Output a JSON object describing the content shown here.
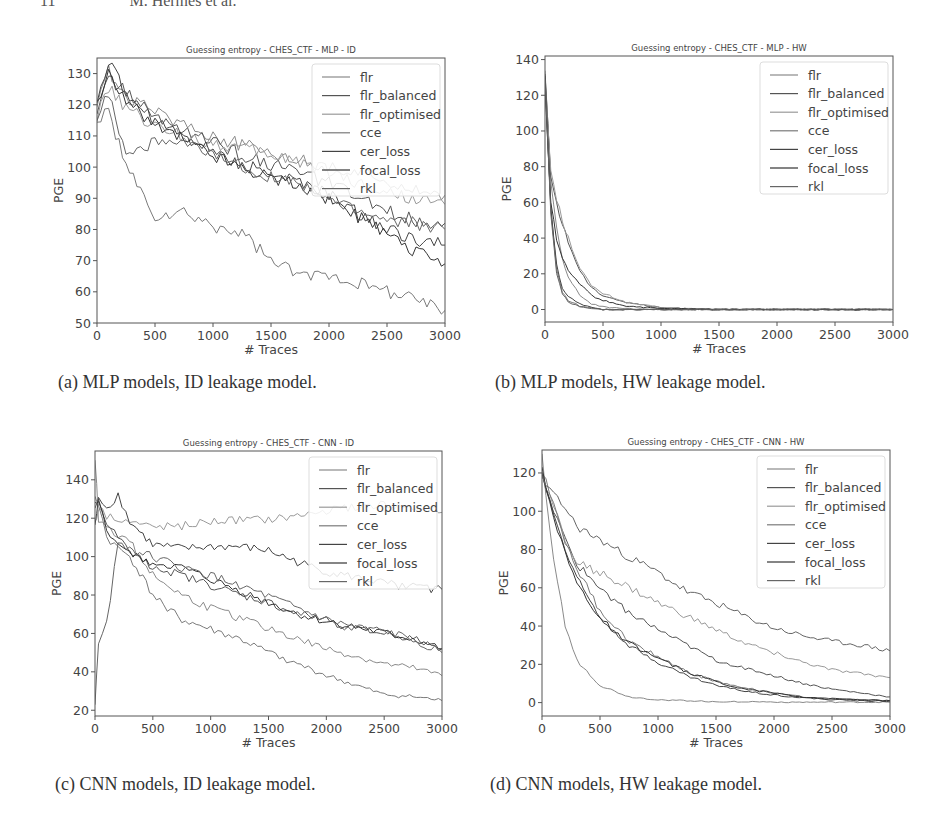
{
  "page_header": {
    "page_number": "11",
    "running_title": "M. Hermes et al."
  },
  "captions": {
    "a": "(a) MLP models, ID leakage model.",
    "b": "(b) MLP models, HW leakage model.",
    "c": "(c) CNN models, ID leakage model.",
    "d": "(d) CNN models, HW leakage model."
  },
  "legend_entries": [
    "flr",
    "flr_balanced",
    "flr_optimised",
    "cce",
    "cer_loss",
    "focal_loss",
    "rkl"
  ],
  "series_colors": [
    "#8a8a8a",
    "#555555",
    "#9a9a9a",
    "#7a7a7a",
    "#444444",
    "#333333",
    "#666666"
  ],
  "chart_data": [
    {
      "id": "a",
      "type": "line",
      "title": "Guessing entropy - CHES_CTF - MLP - ID",
      "xlabel": "# Traces",
      "ylabel": "PGE",
      "xlim": [
        0,
        3000
      ],
      "ylim": [
        50,
        135
      ],
      "xticks": [
        0,
        500,
        1000,
        1500,
        2000,
        2500,
        3000
      ],
      "yticks": [
        50,
        60,
        70,
        80,
        90,
        100,
        110,
        120,
        130
      ],
      "grid": false,
      "legend_position": "upper right",
      "x": [
        0,
        100,
        250,
        500,
        750,
        1000,
        1250,
        1500,
        1750,
        2000,
        2250,
        2500,
        2750,
        3000
      ],
      "series": [
        {
          "name": "flr",
          "values": [
            120,
            131,
            122,
            118,
            114,
            110,
            107,
            105,
            102,
            100,
            98,
            96,
            93,
            91
          ]
        },
        {
          "name": "flr_balanced",
          "values": [
            118,
            128,
            124,
            116,
            112,
            108,
            104,
            101,
            98,
            95,
            90,
            86,
            83,
            82
          ]
        },
        {
          "name": "flr_optimised",
          "values": [
            116,
            125,
            119,
            113,
            110,
            108,
            106,
            104,
            102,
            99,
            95,
            92,
            90,
            88
          ]
        },
        {
          "name": "cce",
          "values": [
            115,
            118,
            100,
            84,
            85,
            81,
            79,
            70,
            65,
            66,
            63,
            60,
            58,
            54
          ]
        },
        {
          "name": "cer_loss",
          "values": [
            122,
            133,
            124,
            115,
            110,
            105,
            101,
            98,
            95,
            91,
            85,
            80,
            77,
            75
          ]
        },
        {
          "name": "focal_loss",
          "values": [
            119,
            130,
            121,
            114,
            109,
            104,
            100,
            97,
            94,
            90,
            84,
            78,
            73,
            69
          ]
        },
        {
          "name": "rkl",
          "values": [
            117,
            124,
            104,
            108,
            107,
            104,
            100,
            97,
            94,
            90,
            86,
            83,
            82,
            80
          ]
        }
      ]
    },
    {
      "id": "b",
      "type": "line",
      "title": "Guessing entropy - CHES_CTF - MLP - HW",
      "xlabel": "# Traces",
      "ylabel": "PGE",
      "xlim": [
        0,
        3000
      ],
      "ylim": [
        -7,
        142
      ],
      "xticks": [
        0,
        500,
        1000,
        1500,
        2000,
        2500,
        3000
      ],
      "yticks": [
        0,
        20,
        40,
        60,
        80,
        100,
        120,
        140
      ],
      "grid": false,
      "legend_position": "upper right",
      "x": [
        0,
        50,
        100,
        150,
        200,
        300,
        400,
        500,
        700,
        1000,
        1500,
        2000,
        2500,
        3000
      ],
      "series": [
        {
          "name": "flr",
          "values": [
            135,
            70,
            45,
            28,
            18,
            8,
            3,
            1.5,
            0.5,
            0,
            0,
            0,
            0,
            0
          ]
        },
        {
          "name": "flr_balanced",
          "values": [
            130,
            75,
            60,
            48,
            38,
            22,
            12,
            8,
            4,
            1,
            0,
            0,
            0,
            0
          ]
        },
        {
          "name": "flr_optimised",
          "values": [
            128,
            78,
            62,
            50,
            40,
            24,
            13,
            9,
            4,
            1,
            0,
            0,
            0,
            0
          ]
        },
        {
          "name": "cce",
          "values": [
            125,
            55,
            22,
            10,
            5,
            2,
            1,
            0,
            0,
            0,
            0,
            0,
            0,
            0
          ]
        },
        {
          "name": "cer_loss",
          "values": [
            133,
            58,
            25,
            12,
            7,
            3,
            1,
            0,
            0,
            0,
            0,
            0,
            0,
            0
          ]
        },
        {
          "name": "focal_loss",
          "values": [
            127,
            60,
            38,
            28,
            22,
            14,
            8,
            5,
            2,
            0.5,
            0,
            0,
            0,
            0
          ]
        },
        {
          "name": "rkl",
          "values": [
            131,
            52,
            20,
            9,
            4,
            1.5,
            0.5,
            0,
            0,
            0,
            0,
            0,
            0,
            0
          ]
        }
      ]
    },
    {
      "id": "c",
      "type": "line",
      "title": "Guessing entropy - CHES_CTF - CNN - ID",
      "xlabel": "# Traces",
      "ylabel": "PGE",
      "xlim": [
        0,
        3000
      ],
      "ylim": [
        17,
        155
      ],
      "xticks": [
        0,
        500,
        1000,
        1500,
        2000,
        2500,
        3000
      ],
      "yticks": [
        20,
        40,
        60,
        80,
        100,
        120,
        140
      ],
      "grid": false,
      "legend_position": "upper right",
      "x": [
        0,
        30,
        100,
        200,
        300,
        500,
        750,
        1000,
        1250,
        1500,
        1750,
        2000,
        2250,
        2500,
        2750,
        3000
      ],
      "series": [
        {
          "name": "flr",
          "values": [
            152,
            120,
            115,
            112,
            108,
            90,
            80,
            73,
            68,
            63,
            57,
            52,
            48,
            44,
            42,
            38
          ]
        },
        {
          "name": "flr_balanced",
          "values": [
            125,
            130,
            118,
            110,
            102,
            95,
            90,
            85,
            80,
            76,
            70,
            67,
            62,
            60,
            57,
            52
          ]
        },
        {
          "name": "flr_optimised",
          "values": [
            118,
            125,
            121,
            120,
            118,
            115,
            116,
            118,
            119,
            119,
            121,
            124,
            126,
            127,
            125,
            123
          ]
        },
        {
          "name": "cce",
          "values": [
            130,
            128,
            110,
            104,
            100,
            80,
            67,
            62,
            57,
            50,
            44,
            38,
            33,
            28,
            27,
            25
          ]
        },
        {
          "name": "cer_loss",
          "values": [
            115,
            132,
            125,
            132,
            118,
            106,
            104,
            105,
            105,
            103,
            97,
            92,
            89,
            86,
            84,
            83
          ]
        },
        {
          "name": "focal_loss",
          "values": [
            128,
            130,
            113,
            107,
            101,
            97,
            94,
            88,
            82,
            76,
            70,
            66,
            63,
            60,
            57,
            52
          ]
        },
        {
          "name": "rkl",
          "values": [
            22,
            55,
            65,
            108,
            104,
            100,
            94,
            90,
            85,
            79,
            73,
            67,
            63,
            61,
            57,
            50
          ]
        }
      ]
    },
    {
      "id": "d",
      "type": "line",
      "title": "Guessing entropy - CHES_CTF - CNN - HW",
      "xlabel": "# Traces",
      "ylabel": "PGE",
      "xlim": [
        0,
        3000
      ],
      "ylim": [
        -7,
        132
      ],
      "xticks": [
        0,
        500,
        1000,
        1500,
        2000,
        2500,
        3000
      ],
      "yticks": [
        0,
        20,
        40,
        60,
        80,
        100,
        120
      ],
      "grid": false,
      "legend_position": "upper right",
      "x": [
        0,
        100,
        200,
        300,
        500,
        750,
        1000,
        1250,
        1500,
        1750,
        2000,
        2250,
        2500,
        2750,
        3000
      ],
      "series": [
        {
          "name": "flr",
          "values": [
            128,
            75,
            40,
            22,
            9,
            3,
            1.5,
            1,
            0.5,
            0.5,
            0.3,
            0.2,
            0.2,
            0.2,
            0.2
          ]
        },
        {
          "name": "flr_balanced",
          "values": [
            120,
            100,
            85,
            72,
            60,
            47,
            38,
            30,
            22,
            18,
            14,
            10,
            7,
            5,
            3
          ]
        },
        {
          "name": "flr_optimised",
          "values": [
            118,
            102,
            85,
            73,
            68,
            60,
            52,
            45,
            38,
            31,
            26,
            21,
            17,
            15,
            13
          ]
        },
        {
          "name": "cce",
          "values": [
            121,
            105,
            85,
            70,
            48,
            32,
            24,
            16,
            11,
            8,
            5,
            3,
            2,
            1.5,
            1
          ]
        },
        {
          "name": "cer_loss",
          "values": [
            119,
            100,
            80,
            65,
            45,
            30,
            21,
            14,
            9,
            6,
            4,
            2.5,
            1.5,
            1,
            0.8
          ]
        },
        {
          "name": "focal_loss",
          "values": [
            122,
            98,
            78,
            62,
            44,
            31,
            23,
            16,
            11,
            7,
            5,
            3,
            2,
            1.5,
            1
          ]
        },
        {
          "name": "rkl",
          "values": [
            117,
            108,
            102,
            92,
            85,
            76,
            68,
            58,
            52,
            45,
            39,
            35,
            32,
            30,
            27
          ]
        }
      ]
    }
  ]
}
